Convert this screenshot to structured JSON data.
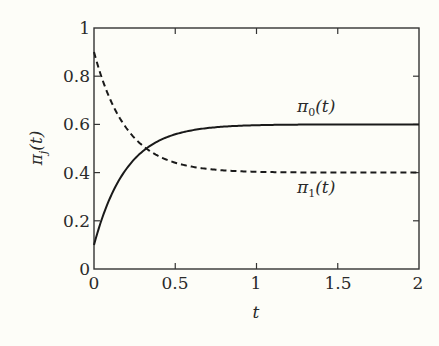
{
  "chart_data": {
    "type": "line",
    "title": "",
    "xlabel": "t",
    "ylabel": "π_j(t)",
    "xlim": [
      0,
      2
    ],
    "ylim": [
      0,
      1
    ],
    "grid": false,
    "legend": "inline labels",
    "x_ticks": [
      "0",
      "0.5",
      "1",
      "1.5",
      "2"
    ],
    "y_ticks": [
      "0",
      "0.2",
      "0.4",
      "0.6",
      "0.8",
      "1"
    ],
    "x": [
      0,
      0.1,
      0.2,
      0.3,
      0.4,
      0.5,
      0.75,
      1.0,
      1.5,
      2.0
    ],
    "series": [
      {
        "name": "π0(t)",
        "style": "solid",
        "formula": "0.6 - 0.5*exp(-5t)",
        "values": [
          0.1,
          0.3,
          0.42,
          0.49,
          0.53,
          0.56,
          0.59,
          0.6,
          0.6,
          0.6
        ]
      },
      {
        "name": "π1(t)",
        "style": "dashed",
        "formula": "0.4 + 0.5*exp(-5t)",
        "values": [
          0.9,
          0.7,
          0.58,
          0.51,
          0.47,
          0.44,
          0.41,
          0.4,
          0.4,
          0.4
        ]
      }
    ],
    "annotations": [
      {
        "text": "π0(t)",
        "x": 1.4,
        "y": 0.64
      },
      {
        "text": "π1(t)",
        "x": 1.4,
        "y": 0.36
      }
    ]
  },
  "labels": {
    "y": [
      "0",
      "0.2",
      "0.4",
      "0.6",
      "0.8",
      "1"
    ],
    "x": [
      "0",
      "0.5",
      "1",
      "1.5",
      "2"
    ],
    "xaxis": "t",
    "yaxis_main": "π",
    "yaxis_sub": "j",
    "yaxis_arg": "(t)",
    "pi0_main": "π",
    "pi0_sub": "0",
    "pi0_arg": "(t)",
    "pi1_main": "π",
    "pi1_sub": "1",
    "pi1_arg": "(t)"
  }
}
